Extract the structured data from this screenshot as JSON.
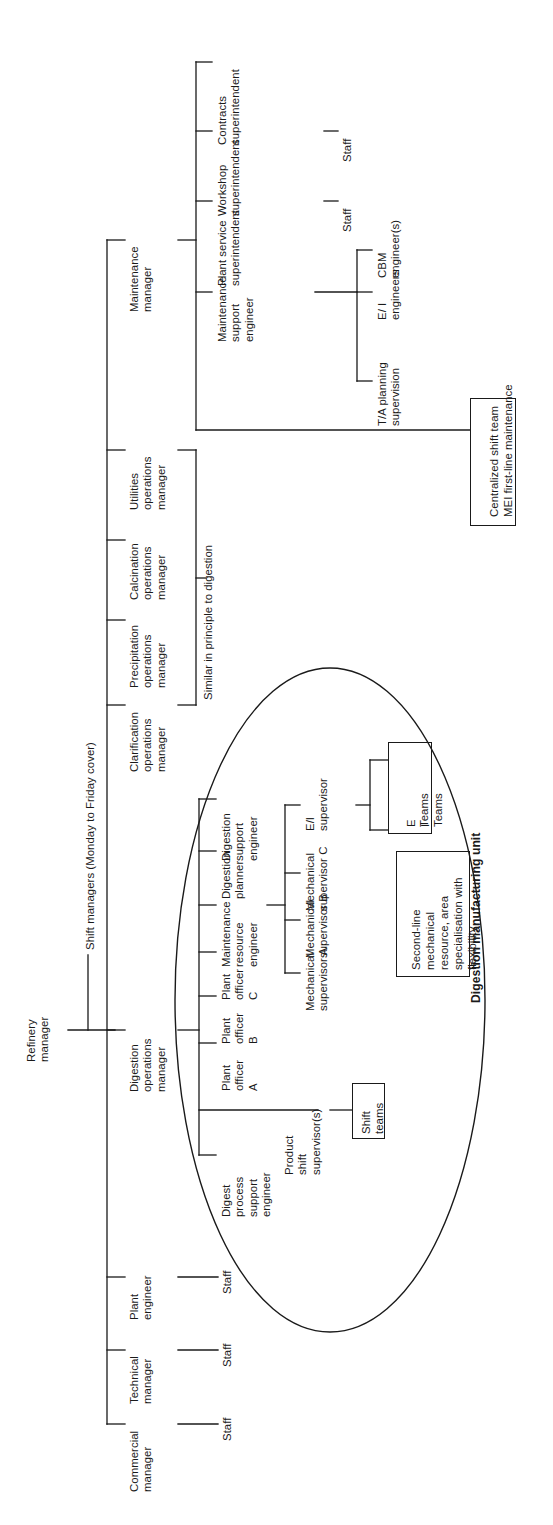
{
  "diagram": {
    "root": {
      "label": "Refinery\nmanager",
      "name": "refinery-manager"
    },
    "shift_managers_note": "Shift managers (Monday to Friday cover)",
    "similar_note": "Similar in principle to digestion",
    "highlight_label": "Digestion manufacturing unit",
    "top_level_branches": [
      {
        "name": "maintenance-manager",
        "label": "Maintenance\nmanager"
      },
      {
        "name": "utilities-operations-manager",
        "label": "Utilities\noperations\nmanager"
      },
      {
        "name": "calcination-operations-manager",
        "label": "Calcination\noperations\nmanager"
      },
      {
        "name": "precipitation-operations-manager",
        "label": "Precipitation\noperations\nmanager"
      },
      {
        "name": "clarification-operations-manager",
        "label": "Clarification\noperations\nmanager"
      },
      {
        "name": "digestion-operations-manager",
        "label": "Digestion\noperations\nmanager"
      },
      {
        "name": "plant-engineer",
        "label": "Plant\nengineer"
      },
      {
        "name": "technical-manager",
        "label": "Technical\nmanager"
      },
      {
        "name": "commercial-manager",
        "label": "Commercial\nmanager"
      }
    ],
    "maintenance_children": [
      {
        "name": "contracts-superintendent",
        "label": "Contracts\nsuperintendent"
      },
      {
        "name": "workshop-superintendent",
        "label": "Workshop\nsuperintendent"
      },
      {
        "name": "plant-service-superintendent",
        "label": "Plant service\nsuperintendent"
      },
      {
        "name": "maintenance-support-engineer",
        "label": "Maintenance\nsupport\nengineer"
      }
    ],
    "maintenance_support_children": [
      {
        "name": "cbm-engineers",
        "label": "CBM\nengineer(s)"
      },
      {
        "name": "ei-engineers",
        "label": "E/ I\nengineers"
      },
      {
        "name": "ta-planning-supervision",
        "label": "T/A planning\nsupervision"
      }
    ],
    "staff_labels": {
      "workshop_staff": "Staff",
      "plant_service_staff": "Staff",
      "plant_engineer_staff": "Staff",
      "technical_manager_staff": "Staff",
      "commercial_manager_staff": "Staff"
    },
    "digestion_children": [
      {
        "name": "digestion-support-engineer",
        "label": "Digestion\nsupport\nengineer"
      },
      {
        "name": "digestion-planner",
        "label": "Digestion\nplanner"
      },
      {
        "name": "maintenance-resource-engineer",
        "label": "Maintenance\nresource\nengineer"
      },
      {
        "name": "plant-officer-c",
        "label": "Plant\nofficer\nC"
      },
      {
        "name": "plant-officer-b",
        "label": "Plant\nofficer\nB"
      },
      {
        "name": "plant-officer-a",
        "label": "Plant\nofficer\nA"
      },
      {
        "name": "digest-process-support-engineer",
        "label": "Digest\nprocess\nsupport\nengineer"
      }
    ],
    "maintenance_resource_children": [
      {
        "name": "ei-supervisor",
        "label": "E/I\nsupervisor"
      },
      {
        "name": "mechanical-supervisor-c",
        "label": "Mechanical\nsupervisor C"
      },
      {
        "name": "mechanical-supervisor-b",
        "label": "Mechanical\nsupervisor B"
      },
      {
        "name": "mechanical-supervisor-a",
        "label": "Mechanical\nsupervisor A"
      }
    ],
    "product_shift_supervisor": {
      "name": "product-shift-supervisor",
      "label": "Product\nshift\nsupervisor(s)"
    },
    "boxes": [
      {
        "name": "centralized-shift-team-box",
        "line1": "Centralized shift team",
        "line2": "MEI first-line maintenance"
      },
      {
        "name": "e-i-teams-box",
        "col1": "E\nTeams",
        "col2": "I\nTeams"
      },
      {
        "name": "second-line-mechanical-box",
        "text": "Second-line\nmechanical\nresource, area\nspecialisation with\nflexibility"
      },
      {
        "name": "shift-teams-box",
        "text": "Shift\nteams"
      }
    ],
    "colors": {
      "ink": "#1a1a1a",
      "background": "#ffffff"
    }
  }
}
